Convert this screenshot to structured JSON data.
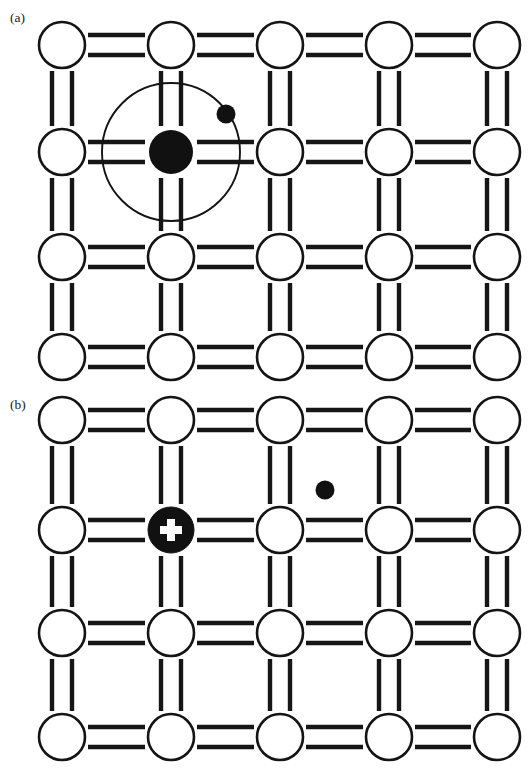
{
  "figure": {
    "width": 530,
    "height": 771,
    "background_color": "#ffffff",
    "line_color": "#161616",
    "atom_fill_color": "#ffffff",
    "atom_stroke_color": "#141414",
    "marker_fill_color": "#111111"
  },
  "panels": [
    {
      "id": "panel-a",
      "label": "(a)",
      "label_x": 10,
      "label_y": 22,
      "description": "Neutral donor atom with a loosely bound fifth valence electron orbiting the nucleus",
      "lattice": {
        "columns": 5,
        "rows": 4,
        "column_x": [
          62,
          171,
          280,
          389,
          497
        ],
        "row_y": [
          45,
          152,
          257,
          357
        ],
        "atom_radius": 23,
        "bond_offset": 10,
        "bond_thickness": 4.4
      },
      "special": {
        "dopant_site": {
          "column": 1,
          "row": 1
        },
        "nucleus": {
          "cx": 171,
          "cy": 152,
          "r": 22,
          "color": "#111111"
        },
        "orbit": {
          "cx": 171,
          "cy": 152,
          "r": 69,
          "stroke": "#141414",
          "stroke_width": 1.9
        },
        "electron": {
          "cx": 226,
          "cy": 114,
          "r": 9.5,
          "color": "#111111"
        }
      }
    },
    {
      "id": "panel-b",
      "label": "(b)",
      "label_x": 10,
      "label_y": 409,
      "description": "Ionized donor with positive charge and a liberated free electron in the lattice",
      "lattice": {
        "columns": 5,
        "rows": 4,
        "column_x": [
          62,
          171,
          280,
          389,
          497
        ],
        "row_y": [
          420,
          530,
          633,
          737
        ],
        "atom_radius": 23,
        "bond_offset": 10,
        "bond_thickness": 4.4
      },
      "special": {
        "ion_site": {
          "column": 1,
          "row": 1
        },
        "ion_core": {
          "cx": 171,
          "cy": 530,
          "r": 23,
          "color": "#111111"
        },
        "ion_charge_symbol": "+",
        "plus_arm_length": 22,
        "plus_arm_width": 8,
        "free_electron": {
          "cx": 325,
          "cy": 490,
          "r": 9.5,
          "color": "#111111"
        }
      }
    }
  ]
}
